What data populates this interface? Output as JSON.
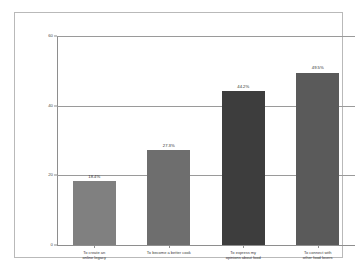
{
  "chart_data": {
    "type": "bar",
    "title": "",
    "subtitle": "",
    "xlabel": "",
    "ylabel": "",
    "ylim": [
      0,
      60
    ],
    "grid": true,
    "legend": null,
    "categories": [
      "To create an online legacy",
      "To become a better cook",
      "To express my opinions about food",
      "To connect with other food lovers"
    ],
    "category_lines": [
      [
        "To create an",
        "online legacy"
      ],
      [
        "To become a better cook",
        ""
      ],
      [
        "To express my",
        "opinions about food"
      ],
      [
        "To connect with",
        "other food lovers"
      ]
    ],
    "values": [
      18.4,
      27.3,
      44.2,
      49.5
    ],
    "value_labels": [
      "18.4%",
      "27.3%",
      "44.2%",
      "49.5%"
    ],
    "bar_colors": [
      "#808080",
      "#6e6e6e",
      "#3d3d3d",
      "#5a5a5a"
    ],
    "yticks": [
      0,
      20,
      40,
      60
    ],
    "ytick_labels": [
      "0",
      "20",
      "40",
      "60"
    ]
  },
  "style": {
    "background": "#ffffff",
    "frame_color": "#b9b9b9",
    "axis_color": "#8e8e8e",
    "grid_color": "#9a9a9a",
    "text_color": "#3a3a3a"
  }
}
